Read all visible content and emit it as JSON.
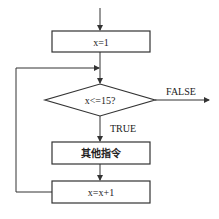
{
  "diagram": {
    "type": "flowchart",
    "colors": {
      "stroke": "#333333",
      "text": "#222222",
      "background": "#ffffff"
    },
    "nodes": [
      {
        "id": "init",
        "shape": "rect",
        "label": "x=1"
      },
      {
        "id": "cond",
        "shape": "diamond",
        "label": "x<=15?"
      },
      {
        "id": "body",
        "shape": "rect",
        "label": "其他指令"
      },
      {
        "id": "incr",
        "shape": "rect",
        "label": "x=x+1"
      }
    ],
    "edges": [
      {
        "from": "start",
        "to": "init",
        "label": ""
      },
      {
        "from": "init",
        "to": "cond",
        "label": ""
      },
      {
        "from": "cond",
        "to": "exit",
        "label": "FALSE"
      },
      {
        "from": "cond",
        "to": "body",
        "label": "TRUE"
      },
      {
        "from": "body",
        "to": "incr",
        "label": ""
      },
      {
        "from": "incr",
        "to": "cond",
        "label": ""
      }
    ],
    "labels": {
      "false_label": "FALSE",
      "true_label": "TRUE"
    }
  }
}
